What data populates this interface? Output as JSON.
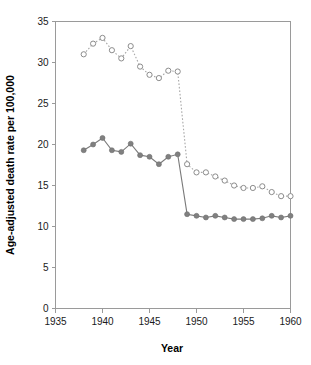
{
  "chart_data": {
    "type": "line",
    "title": "",
    "subtitle": "",
    "xlabel": "Year",
    "ylabel": "Age-adjusted death rate per 100,000",
    "xlim": [
      1935,
      1960
    ],
    "ylim": [
      0,
      35
    ],
    "xticks": [
      1935,
      1940,
      1945,
      1950,
      1955,
      1960
    ],
    "xticklabels": [
      "1935",
      "1940",
      "1945",
      "1950",
      "1955",
      "1960"
    ],
    "yticks": [
      0,
      5,
      10,
      15,
      20,
      25,
      30,
      35
    ],
    "yticklabels": [
      "0",
      "5",
      "10",
      "15",
      "20",
      "25",
      "30",
      "35"
    ],
    "grid": false,
    "legend": "none",
    "x": [
      1938,
      1939,
      1940,
      1941,
      1942,
      1943,
      1944,
      1945,
      1946,
      1947,
      1948,
      1949,
      1950,
      1951,
      1952,
      1953,
      1954,
      1955,
      1956,
      1957,
      1958,
      1959,
      1960
    ],
    "series": [
      {
        "name": "open-circle-series",
        "marker": "open-circle",
        "linestyle": "dotted",
        "color": "#8c8c8c",
        "values": [
          31.0,
          32.3,
          33.0,
          31.5,
          30.5,
          32.0,
          29.5,
          28.5,
          28.1,
          29.0,
          28.9,
          17.6,
          16.6,
          16.6,
          16.1,
          15.6,
          15.0,
          14.7,
          14.7,
          14.9,
          14.2,
          13.7,
          13.7
        ]
      },
      {
        "name": "filled-circle-series",
        "marker": "filled-circle",
        "linestyle": "solid",
        "color": "#808080",
        "values": [
          19.3,
          20.0,
          20.8,
          19.3,
          19.1,
          20.1,
          18.7,
          18.5,
          17.6,
          18.5,
          18.8,
          11.5,
          11.3,
          11.1,
          11.3,
          11.1,
          10.9,
          10.9,
          10.9,
          11.0,
          11.3,
          11.1,
          11.3
        ]
      }
    ]
  },
  "axis": {
    "x_title": "Year",
    "y_title": "Age-adjusted death rate per 100,000"
  },
  "colors": {
    "axis": "#9a9a9a",
    "text": "#000000",
    "solid_series": "#808080",
    "open_series": "#8c8c8c",
    "background": "#ffffff"
  }
}
